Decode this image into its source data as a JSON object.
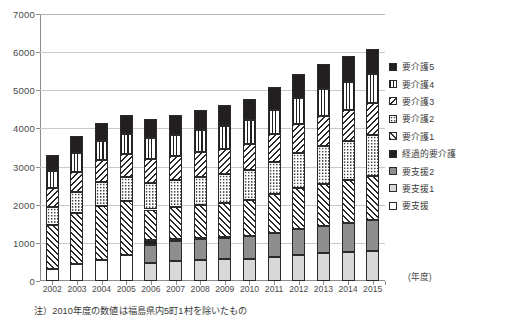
{
  "chart_data": {
    "type": "bar",
    "stacked": true,
    "title": "",
    "xlabel": "(年度)",
    "ylabel": "",
    "ylim": [
      0,
      7000
    ],
    "ytick_step": 1000,
    "yticks": [
      "0",
      "1000",
      "2000",
      "3000",
      "4000",
      "5000",
      "6000",
      "7000"
    ],
    "grid": true,
    "legend_position": "right",
    "categories": [
      "2002",
      "2003",
      "2004",
      "2005",
      "2006",
      "2007",
      "2008",
      "2009",
      "2010",
      "2011",
      "2012",
      "2013",
      "2014",
      "2015"
    ],
    "series_order_bottom_to_top": [
      "要支援",
      "要支援1",
      "要支援2",
      "経過的要介護",
      "要介護1",
      "要介護2",
      "要介護3",
      "要介護4",
      "要介護5"
    ],
    "series": [
      {
        "name": "要支援",
        "pattern": "white",
        "values": [
          314,
          451,
          553,
          674,
          0,
          0,
          0,
          0,
          0,
          0,
          0,
          0,
          0,
          0
        ]
      },
      {
        "name": "要支援1",
        "pattern": "light-gray",
        "values": [
          0,
          0,
          0,
          0,
          477,
          519,
          549,
          568,
          588,
          633,
          686,
          729,
          764,
          800
        ]
      },
      {
        "name": "要支援2",
        "pattern": "gray",
        "values": [
          0,
          0,
          0,
          0,
          478,
          524,
          551,
          569,
          587,
          625,
          678,
          720,
          757,
          795
        ]
      },
      {
        "name": "経過的要介護",
        "pattern": "solid-black",
        "values": [
          0,
          0,
          0,
          0,
          132,
          50,
          16,
          5,
          0,
          0,
          0,
          0,
          0,
          0
        ]
      },
      {
        "name": "要介護1",
        "pattern": "hatch-fwd",
        "values": [
          1144,
          1329,
          1425,
          1419,
          788,
          835,
          874,
          906,
          943,
          1018,
          1077,
          1106,
          1126,
          1166
        ]
      },
      {
        "name": "要介護2",
        "pattern": "dots",
        "values": [
          494,
          552,
          613,
          646,
          706,
          722,
          740,
          760,
          790,
          849,
          925,
          981,
          1025,
          1062
        ]
      },
      {
        "name": "要介護3",
        "pattern": "hatch-back",
        "values": [
          478,
          535,
          572,
          593,
          616,
          632,
          647,
          664,
          688,
          721,
          756,
          785,
          811,
          837
        ]
      },
      {
        "name": "要介護4",
        "pattern": "vertical",
        "values": [
          457,
          492,
          513,
          527,
          544,
          557,
          572,
          590,
          613,
          646,
          679,
          710,
          739,
          770
        ]
      },
      {
        "name": "要介護5",
        "pattern": "solid-black",
        "values": [
          418,
          447,
          469,
          483,
          500,
          513,
          528,
          543,
          566,
          598,
          629,
          657,
          681,
          647
        ]
      }
    ],
    "totals": [
      3305,
      3806,
      4145,
      4342,
      4241,
      4352,
      4477,
      4605,
      4775,
      5090,
      5430,
      5688,
      5903,
      6077
    ]
  },
  "axes": {
    "y_unit": "",
    "x_unit_label": "(年度)"
  },
  "legend": {
    "items": [
      {
        "label": "要介護5",
        "pattern": "solid-black"
      },
      {
        "label": "要介護4",
        "pattern": "vertical"
      },
      {
        "label": "要介護3",
        "pattern": "hatch-back"
      },
      {
        "label": "要介護2",
        "pattern": "dots"
      },
      {
        "label": "要介護1",
        "pattern": "hatch-fwd"
      },
      {
        "label": "経過的要介護",
        "pattern": "solid-black"
      },
      {
        "label": "要支援2",
        "pattern": "gray"
      },
      {
        "label": "要支援1",
        "pattern": "light-gray"
      },
      {
        "label": "要支援",
        "pattern": "white"
      }
    ]
  },
  "footnote": {
    "text": "注）2010年度の数値は福島県内5町1村を除いたもの"
  },
  "colors": {
    "axis": "#8d8d8d",
    "grid": "#c9c9c9",
    "text": "#3a3a3a",
    "black_fill": "#231f20",
    "gray_fill": "#8e8e8e",
    "light_gray_fill": "#d8d8d8"
  }
}
